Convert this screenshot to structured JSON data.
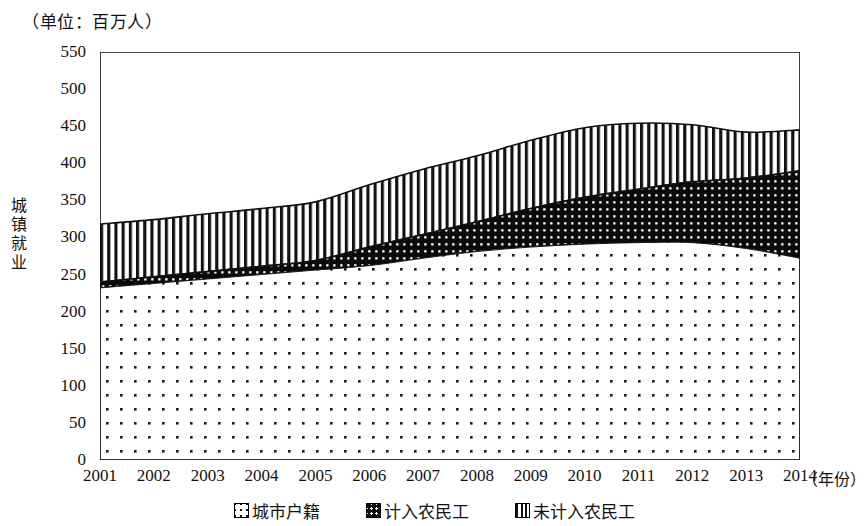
{
  "chart_data": {
    "type": "area",
    "title": "（单位：百万人）",
    "ylabel": "城镇就业",
    "xlabel": "（年份）",
    "categories": [
      "2001",
      "2002",
      "2003",
      "2004",
      "2005",
      "2006",
      "2007",
      "2008",
      "2009",
      "2010",
      "2011",
      "2012",
      "2013",
      "2014"
    ],
    "ylim": [
      0,
      550
    ],
    "ytick_step": 50,
    "yticks": [
      "550",
      "500",
      "450",
      "400",
      "350",
      "300",
      "250",
      "200",
      "150",
      "100",
      "50",
      "0"
    ],
    "grid": false,
    "legend_position": "bottom",
    "stacked": true,
    "series": [
      {
        "name": "城市户籍",
        "pattern": "light-dots",
        "values": [
          232,
          238,
          244,
          250,
          256,
          262,
          272,
          281,
          287,
          291,
          293,
          293,
          285,
          272
        ]
      },
      {
        "name": "计入农民工",
        "pattern": "dark-dots",
        "values": [
          8,
          9,
          10,
          11,
          13,
          25,
          32,
          40,
          52,
          63,
          72,
          82,
          95,
          118
        ]
      },
      {
        "name": "未计入农民工",
        "pattern": "vertical-stripes",
        "values": [
          78,
          77,
          78,
          78,
          79,
          84,
          88,
          89,
          92,
          94,
          89,
          77,
          62,
          55
        ]
      }
    ],
    "totals": [
      318,
      324,
      332,
      339,
      348,
      371,
      392,
      410,
      431,
      448,
      454,
      452,
      442,
      445
    ]
  },
  "legend": {
    "items": [
      {
        "label": "城市户籍"
      },
      {
        "label": "计入农民工"
      },
      {
        "label": "未计入农民工"
      }
    ]
  }
}
